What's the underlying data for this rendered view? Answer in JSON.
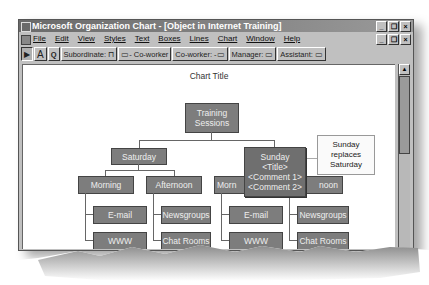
{
  "window": {
    "title": "Microsoft Organization Chart - [Object in Internet Training]",
    "controls": {
      "minimize": "_",
      "restore": "❐",
      "close": "×"
    }
  },
  "menubar": {
    "items": [
      "File",
      "Edit",
      "View",
      "Styles",
      "Text",
      "Boxes",
      "Lines",
      "Chart",
      "Window",
      "Help"
    ]
  },
  "toolbar": {
    "tools": [
      {
        "name": "select-tool",
        "label": "▶"
      },
      {
        "name": "text-tool",
        "label": "A"
      },
      {
        "name": "zoom-tool",
        "label": "Q"
      },
      {
        "name": "subordinate-button",
        "label": "Subordinate: ⊓"
      },
      {
        "name": "coworker-left-button",
        "label": "▭- Co-worker"
      },
      {
        "name": "coworker-right-button",
        "label": "Co-worker: -▭"
      },
      {
        "name": "manager-button",
        "label": "Manager: ▭"
      },
      {
        "name": "assistant-button",
        "label": "Assistant: ▭"
      }
    ]
  },
  "chart": {
    "title": "Chart Title",
    "root": "Training Sessions",
    "saturday": {
      "label": "Saturday",
      "morning": "Morning",
      "afternoon": "Afternoon",
      "morning_children": [
        "E-mail",
        "WWW"
      ],
      "afternoon_children": [
        "Newsgroups",
        "Chat Rooms"
      ]
    },
    "sunday": {
      "label": "Sunday",
      "title_placeholder": "<Title>",
      "comment1": "<Comment 1>",
      "comment2": "<Comment 2>",
      "morning_partial": "Morn",
      "afternoon_partial": "noon",
      "morning_children": [
        "E-mail",
        "WWW"
      ],
      "afternoon_children": [
        "Newsgroups",
        "Chat Rooms"
      ]
    }
  },
  "callout": {
    "text_line1": "Sunday",
    "text_line2": "replaces",
    "text_line3": "Saturday"
  }
}
